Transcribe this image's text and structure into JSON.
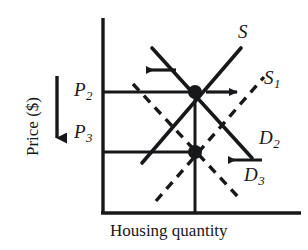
{
  "figure": {
    "type": "supply-demand-diagram"
  },
  "axes": {
    "y_title": "Price ($)",
    "x_title": "Housing quantity",
    "y_axis_x": 103,
    "y_axis_top": 18,
    "y_axis_bottom": 213,
    "x_axis_y": 213,
    "x_axis_right": 301,
    "direction_arrow": "down-arrow-price"
  },
  "price_levels": [
    {
      "id": "p2",
      "label": "P",
      "subscript": "2",
      "y": 92,
      "line_from_x": 103,
      "line_to_x": 195
    },
    {
      "id": "p3",
      "label": "P",
      "subscript": "3",
      "y": 152,
      "line_from_x": 103,
      "line_to_x": 195
    }
  ],
  "equilibria": [
    {
      "id": "equilibrium-upper",
      "x": 195,
      "y": 92,
      "price": "P2"
    },
    {
      "id": "equilibrium-lower",
      "x": 195,
      "y": 152,
      "price": "P3"
    }
  ],
  "curves": [
    {
      "id": "supply-original",
      "label": "S",
      "subscript": "",
      "style": "solid",
      "from": [
        142,
        163
      ],
      "to": [
        241,
        48
      ],
      "label_x": 240,
      "label_y": 31
    },
    {
      "id": "supply-shifted",
      "label": "S",
      "subscript": "1",
      "style": "dashed",
      "from": [
        156,
        201
      ],
      "to": [
        264,
        77
      ],
      "label_x": 266,
      "label_y": 78
    },
    {
      "id": "demand-original",
      "label": "D",
      "subscript": "2",
      "style": "solid",
      "from": [
        152,
        48
      ],
      "to": [
        252,
        158
      ],
      "label_x": 262,
      "label_y": 138
    },
    {
      "id": "demand-shifted",
      "label": "D",
      "subscript": "3",
      "style": "dashed",
      "from": [
        133,
        84
      ],
      "to": [
        240,
        199
      ],
      "label_x": 247,
      "label_y": 175
    }
  ],
  "shift_arrows": [
    {
      "id": "demand-shift-arrow-top",
      "direction": "left",
      "from": [
        175,
        70
      ],
      "to": [
        140,
        70
      ]
    },
    {
      "id": "supply-shift-arrow-right",
      "direction": "right",
      "from": [
        205,
        92
      ],
      "to": [
        243,
        92
      ]
    },
    {
      "id": "demand-shift-arrow-bottom",
      "direction": "left",
      "from": [
        262,
        160
      ],
      "to": [
        222,
        160
      ]
    },
    {
      "id": "price-direction-arrow",
      "direction": "down",
      "from": [
        57,
        76
      ],
      "to": [
        57,
        146
      ]
    }
  ],
  "colors": {
    "ink": "#17181a",
    "background": "#ffffff"
  }
}
